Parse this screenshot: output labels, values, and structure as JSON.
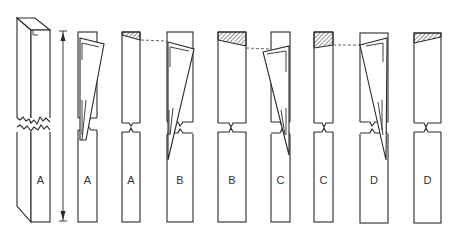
{
  "diagram": {
    "stroke_color": "#2a2a2a",
    "hatch_color": "#2a2a2a",
    "labels": [
      "A",
      "A",
      "A",
      "B",
      "B",
      "C",
      "C",
      "D",
      "D"
    ],
    "dimension_arrow": {
      "direction": "vertical",
      "ends": "double-arrow-with-bars"
    },
    "columns": [
      {
        "id": "A-3d",
        "label": "A",
        "style": "3d-prism",
        "fracture": "jagged-mid"
      },
      {
        "id": "A-tilt",
        "label": "A",
        "style": "tilted-top",
        "fracture": "split"
      },
      {
        "id": "A-final",
        "label": "A",
        "style": "hatched-top",
        "fracture": "notch"
      },
      {
        "id": "B-tilt",
        "label": "B",
        "style": "tilted-top",
        "fracture": "split"
      },
      {
        "id": "B-final",
        "label": "B",
        "style": "hatched-top",
        "fracture": "notch"
      },
      {
        "id": "C-tilt",
        "label": "C",
        "style": "tilted-top",
        "fracture": "split"
      },
      {
        "id": "C-final",
        "label": "C",
        "style": "hatched-top",
        "fracture": "notch"
      },
      {
        "id": "D-tilt",
        "label": "D",
        "style": "tilted-top",
        "fracture": "split"
      },
      {
        "id": "D-final",
        "label": "D",
        "style": "hatched-top",
        "fracture": "notch"
      }
    ]
  }
}
